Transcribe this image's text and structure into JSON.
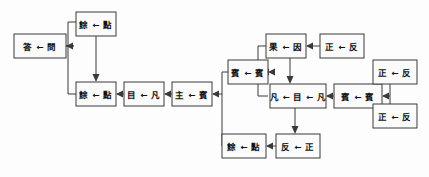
{
  "diagram": {
    "arrow_glyph": "←",
    "colors": {
      "box_fill": "#fbfbfb",
      "stroke": "#3a3a3a",
      "text": "#111111",
      "background": "#fdfdfd"
    },
    "nodes": [
      {
        "id": "n1",
        "name": "answer-question",
        "text": "答 ← 問",
        "x": 14,
        "y": 34,
        "w": 52,
        "h": 24
      },
      {
        "id": "n2",
        "name": "remainder-point-top",
        "text": "餘 ← 點",
        "x": 76,
        "y": 12,
        "w": 40,
        "h": 24
      },
      {
        "id": "n3",
        "name": "remainder-point-mid",
        "text": "餘 ← 點",
        "x": 76,
        "y": 82,
        "w": 40,
        "h": 24
      },
      {
        "id": "n4",
        "name": "eye-ordinary",
        "text": "目 ← 凡",
        "x": 124,
        "y": 82,
        "w": 40,
        "h": 24
      },
      {
        "id": "n5",
        "name": "host-guest",
        "text": "主 ← 賓",
        "x": 172,
        "y": 82,
        "w": 40,
        "h": 24
      },
      {
        "id": "n6",
        "name": "guest-guest-left",
        "text": "賓 ← 賓",
        "x": 228,
        "y": 60,
        "w": 40,
        "h": 24
      },
      {
        "id": "n7",
        "name": "effect-cause",
        "text": "果 ← 因",
        "x": 266,
        "y": 34,
        "w": 40,
        "h": 24
      },
      {
        "id": "n8",
        "name": "upright-reverse-top",
        "text": "正 ← 反",
        "x": 320,
        "y": 34,
        "w": 44,
        "h": 24
      },
      {
        "id": "n9",
        "name": "ordinary-eye-ordinary",
        "text": "凡 ← 目 ← 凡",
        "x": 270,
        "y": 84,
        "w": 56,
        "h": 24
      },
      {
        "id": "n10",
        "name": "guest-guest-right",
        "text": "賓 ← 賓",
        "x": 334,
        "y": 84,
        "w": 48,
        "h": 24
      },
      {
        "id": "n11",
        "name": "upright-reverse-right-a",
        "text": "正 ← 反",
        "x": 373,
        "y": 60,
        "w": 44,
        "h": 24
      },
      {
        "id": "n12",
        "name": "upright-reverse-right-b",
        "text": "正 ← 反",
        "x": 373,
        "y": 104,
        "w": 44,
        "h": 24
      },
      {
        "id": "n13",
        "name": "remainder-point-bottom",
        "text": "餘 ← 點",
        "x": 222,
        "y": 134,
        "w": 44,
        "h": 24
      },
      {
        "id": "n14",
        "name": "reverse-upright",
        "text": "反 ← 正",
        "x": 276,
        "y": 134,
        "w": 44,
        "h": 24
      }
    ],
    "edges": [
      {
        "name": "edge-bus-left-to-answer",
        "from": "bus-left",
        "to": "n1"
      },
      {
        "name": "edge-remainder-top-to-mid",
        "from": "n2",
        "to": "n3"
      },
      {
        "name": "edge-eye-to-remainder-mid",
        "from": "n4",
        "to": "n3"
      },
      {
        "name": "edge-host-to-eye",
        "from": "n5",
        "to": "n4"
      },
      {
        "name": "edge-bus-center-to-host",
        "from": "bus-center",
        "to": "n5"
      },
      {
        "name": "edge-guest-left-to-bus",
        "from": "n6",
        "to": "bus-center"
      },
      {
        "name": "edge-effect-to-bus",
        "from": "n7",
        "to": "bus-center"
      },
      {
        "name": "edge-upright-top-to-effect",
        "from": "n8",
        "to": "n7"
      },
      {
        "name": "edge-effect-to-ordinary",
        "from": "n7",
        "to": "n9"
      },
      {
        "name": "edge-guest-right-to-ordinary",
        "from": "n10",
        "to": "n9"
      },
      {
        "name": "edge-bus-right-to-guest-right",
        "from": "bus-right",
        "to": "n10"
      },
      {
        "name": "edge-upright-a-to-bus-right",
        "from": "n11",
        "to": "bus-right"
      },
      {
        "name": "edge-upright-b-to-bus-right",
        "from": "n12",
        "to": "bus-right"
      },
      {
        "name": "edge-ordinary-to-remainder-bot",
        "from": "n9",
        "to": "n13"
      },
      {
        "name": "edge-reverse-to-remainder-bot",
        "from": "n14",
        "to": "n13"
      },
      {
        "name": "edge-remainder-bot-to-bus",
        "from": "n13",
        "to": "bus-center"
      }
    ]
  }
}
